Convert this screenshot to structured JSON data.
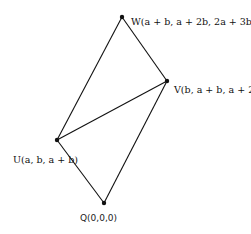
{
  "diagram": {
    "type": "parallelogram",
    "vertices": [
      {
        "id": "Q",
        "label": "Q(0,0,0)",
        "x": 104,
        "y": 203
      },
      {
        "id": "U",
        "label": "U(a, b, a + b)",
        "x": 57,
        "y": 140
      },
      {
        "id": "V",
        "label": "V(b, a + b, a + 2b)",
        "x": 167,
        "y": 81
      },
      {
        "id": "W",
        "label": "W(a + b, a + 2b, 2a + 3b)",
        "x": 122,
        "y": 17
      }
    ],
    "edges": [
      [
        "Q",
        "U"
      ],
      [
        "Q",
        "V"
      ],
      [
        "U",
        "W"
      ],
      [
        "V",
        "W"
      ],
      [
        "U",
        "V"
      ]
    ],
    "colors": {
      "line": "#111111",
      "text": "#111111",
      "background": "#ffffff"
    }
  }
}
